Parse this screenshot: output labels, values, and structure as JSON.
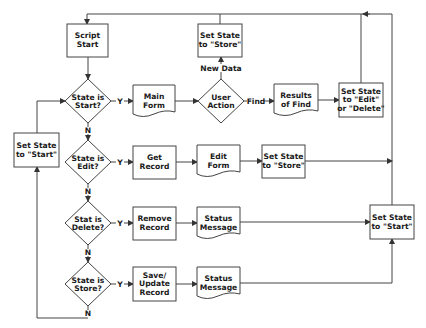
{
  "diagram": {
    "type": "flowchart",
    "colors": {
      "stroke": "#444444",
      "text": "#1a1a1a",
      "background": "#ffffff"
    },
    "nodes": {
      "script_start": {
        "line1": "Script",
        "line2": "Start",
        "shape": "process"
      },
      "dec_start": {
        "line1": "State is",
        "line2": "Start?",
        "shape": "decision"
      },
      "main_form": {
        "line1": "Main",
        "line2": "Form",
        "shape": "document"
      },
      "user_action": {
        "line1": "User",
        "line2": "Action",
        "shape": "decision"
      },
      "set_store_top": {
        "line1": "Set State",
        "line2": "to \"Store\"",
        "shape": "process"
      },
      "results_find": {
        "line1": "Results",
        "line2": "of Find",
        "shape": "document"
      },
      "set_edit_delete": {
        "line1": "Set State",
        "line2": "to \"Edit\"",
        "line3": "or \"Delete\"",
        "shape": "process"
      },
      "set_start_left": {
        "line1": "Set State",
        "line2": "to \"Start\"",
        "shape": "process"
      },
      "dec_edit": {
        "line1": "State is",
        "line2": "Edit?",
        "shape": "decision"
      },
      "get_record": {
        "line1": "Get",
        "line2": "Record",
        "shape": "process"
      },
      "edit_form": {
        "line1": "Edit",
        "line2": "Form",
        "shape": "document"
      },
      "set_store_mid": {
        "line1": "Set State",
        "line2": "to \"Store\"",
        "shape": "process"
      },
      "dec_delete": {
        "line1": "Stat is",
        "line2": "Delete?",
        "shape": "decision"
      },
      "remove_record": {
        "line1": "Remove",
        "line2": "Record",
        "shape": "process"
      },
      "status_msg_1": {
        "line1": "Status",
        "line2": "Message",
        "shape": "document"
      },
      "set_start_right": {
        "line1": "Set State",
        "line2": "to \"Start\"",
        "shape": "process"
      },
      "dec_store": {
        "line1": "State is",
        "line2": "Store?",
        "shape": "decision"
      },
      "save_update": {
        "line1": "Save/",
        "line2": "Update",
        "line3": "Record",
        "shape": "process"
      },
      "status_msg_2": {
        "line1": "Status",
        "line2": "Message",
        "shape": "document"
      }
    },
    "edge_labels": {
      "yes": "Y",
      "no": "N",
      "new_data": "New Data",
      "find": "Find"
    },
    "edges": [
      {
        "from": "script_start",
        "to": "dec_start"
      },
      {
        "from": "dec_start",
        "to": "main_form",
        "label": "Y"
      },
      {
        "from": "dec_start",
        "to": "dec_edit",
        "label": "N"
      },
      {
        "from": "main_form",
        "to": "user_action"
      },
      {
        "from": "user_action",
        "to": "set_store_top",
        "label": "New Data"
      },
      {
        "from": "user_action",
        "to": "results_find",
        "label": "Find"
      },
      {
        "from": "results_find",
        "to": "set_edit_delete"
      },
      {
        "from": "set_store_top",
        "to": "script_start"
      },
      {
        "from": "set_edit_delete",
        "to": "script_start"
      },
      {
        "from": "dec_edit",
        "to": "get_record",
        "label": "Y"
      },
      {
        "from": "dec_edit",
        "to": "dec_delete",
        "label": "N"
      },
      {
        "from": "get_record",
        "to": "edit_form"
      },
      {
        "from": "edit_form",
        "to": "set_store_mid"
      },
      {
        "from": "set_store_mid",
        "to": "script_start"
      },
      {
        "from": "dec_delete",
        "to": "remove_record",
        "label": "Y"
      },
      {
        "from": "dec_delete",
        "to": "dec_store",
        "label": "N"
      },
      {
        "from": "remove_record",
        "to": "status_msg_1"
      },
      {
        "from": "status_msg_1",
        "to": "set_start_right"
      },
      {
        "from": "dec_store",
        "to": "save_update",
        "label": "Y"
      },
      {
        "from": "dec_store",
        "to": "set_start_left",
        "label": "N"
      },
      {
        "from": "save_update",
        "to": "status_msg_2"
      },
      {
        "from": "status_msg_2",
        "to": "set_start_right"
      },
      {
        "from": "set_start_right",
        "to": "script_start"
      },
      {
        "from": "set_start_left",
        "to": "dec_start"
      }
    ]
  }
}
